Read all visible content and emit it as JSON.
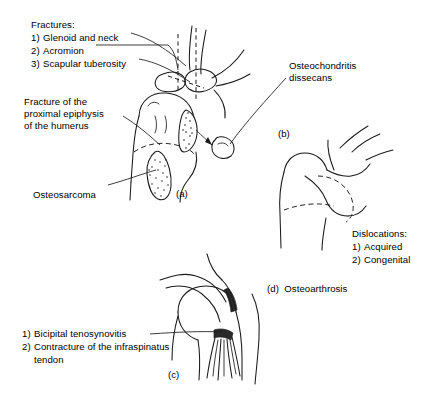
{
  "figure": {
    "title_note": "Shoulder joint pathology plate",
    "labels": {
      "fractures_heading": "Fractures:",
      "fractures_items": [
        {
          "num": "1)",
          "text": "Glenoid and neck"
        },
        {
          "num": "2)",
          "text": "Acromion"
        },
        {
          "num": "3)",
          "text": "Scapular tuberosity"
        }
      ],
      "fracture_epiphysis": "Fracture of the\nproximal epiphysis\nof the humerus",
      "osteosarcoma": "Osteosarcoma",
      "osteochondritis": "Osteochondritis\ndissecans",
      "dislocations_heading": "Dislocations:",
      "dislocations_items": [
        {
          "num": "1)",
          "text": "Acquired"
        },
        {
          "num": "2)",
          "text": "Congenital"
        }
      ],
      "osteoarthrosis": "(d)  Osteoarthrosis",
      "tendon_items": [
        {
          "num": "1)",
          "text": "Bicipital tenosynovitis"
        },
        {
          "num": "2)",
          "text": "Contracture of the infraspinatus"
        },
        {
          "num": "",
          "text": "tendon"
        }
      ]
    },
    "panel_ids": {
      "a": "(a)",
      "b": "(b)",
      "c": "(c)"
    },
    "colors": {
      "ink": "#1a1a1a",
      "background": "#ffffff",
      "shading": "#2a2a2a"
    }
  }
}
